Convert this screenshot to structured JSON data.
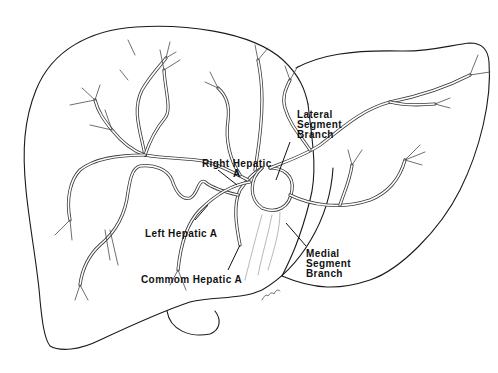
{
  "figure": {
    "colors": {
      "line": "#1a1a1a",
      "background": "#ffffff"
    }
  },
  "labels": {
    "right_hepatic": {
      "line1": "Right Hepatic",
      "line2": "A"
    },
    "left_hepatic": {
      "line1": "Left Hepatic  A"
    },
    "common_hepatic": {
      "line1": "Commom Hepatic A"
    },
    "lateral_segment": {
      "line1": "Lateral",
      "line2": "Segment",
      "line3": "Branch"
    },
    "medial_segment": {
      "line1": "Medial",
      "line2": "Segment",
      "line3": "Branch"
    }
  }
}
